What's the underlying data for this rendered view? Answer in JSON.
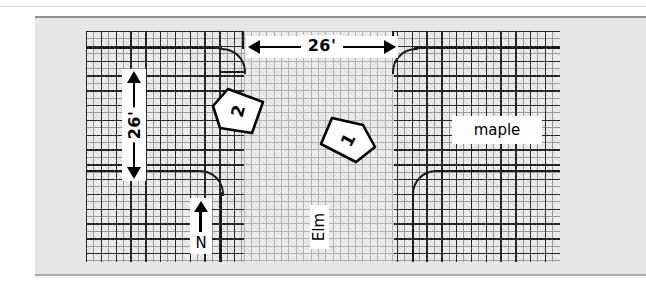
{
  "figure": {
    "title": "",
    "background_color": "#e6e6e6",
    "map_background_color": "#efefef",
    "grid_line_color": "#1f1f1f",
    "ink_color": "#000000"
  },
  "dimensions": {
    "horizontal": {
      "label": "26'",
      "orientation": "horizontal",
      "arrow_style": "double-headed"
    },
    "vertical": {
      "label": "26'",
      "orientation": "vertical",
      "arrow_style": "double-headed"
    }
  },
  "parcels": [
    {
      "id": "parcel-2",
      "label": "2"
    },
    {
      "id": "parcel-1",
      "label": "1"
    }
  ],
  "streets": [
    {
      "id": "street-maple",
      "label": "maple",
      "orientation": "horizontal"
    },
    {
      "id": "street-elm",
      "label": "Elm",
      "orientation": "vertical"
    }
  ],
  "compass": {
    "label": "N",
    "icon": "north-arrow-icon"
  }
}
